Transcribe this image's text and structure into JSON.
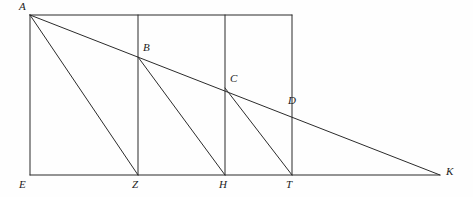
{
  "figure": {
    "width": 473,
    "height": 197,
    "background_color": "#fefefe",
    "stroke_color": "#2b2b2b",
    "stroke_width": 1,
    "label_color": "#1b1b1b"
  },
  "points": [
    {
      "id": "A",
      "label": "A",
      "x": 30,
      "y": 15,
      "label_x": 19,
      "label_y": 1
    },
    {
      "id": "B",
      "label": "B",
      "x": 138,
      "y": 57,
      "label_x": 143,
      "label_y": 42
    },
    {
      "id": "C",
      "label": "C",
      "x": 225,
      "y": 88,
      "label_x": 230,
      "label_y": 73
    },
    {
      "id": "D",
      "label": "D",
      "x": 292,
      "y": 108,
      "label_x": 288,
      "label_y": 95
    },
    {
      "id": "E",
      "label": "E",
      "x": 30,
      "y": 175,
      "label_x": 19,
      "label_y": 179
    },
    {
      "id": "Z",
      "label": "Z",
      "x": 138,
      "y": 175,
      "label_x": 132,
      "label_y": 179
    },
    {
      "id": "H",
      "label": "H",
      "x": 225,
      "y": 175,
      "label_x": 219,
      "label_y": 179
    },
    {
      "id": "T",
      "label": "T",
      "x": 292,
      "y": 175,
      "label_x": 286,
      "label_y": 179
    },
    {
      "id": "K",
      "label": "K",
      "x": 440,
      "y": 175,
      "label_x": 446,
      "label_y": 166
    }
  ],
  "segments": [
    {
      "id": "baseline-E-K",
      "name": "baseline-segment-EK",
      "from": "E",
      "to": "K"
    },
    {
      "id": "top-A-T",
      "name": "top-edge-segment-AD",
      "from": "A",
      "to": "D"
    },
    {
      "id": "vertical-A-E",
      "name": "vertical-segment-AE",
      "from": "A",
      "to": "E"
    },
    {
      "id": "vertical-B-Z",
      "name": "vertical-segment-BZ",
      "from": "B",
      "to": "Z"
    },
    {
      "id": "vertical-C-H",
      "name": "vertical-segment-CH",
      "from": "C",
      "to": "H"
    },
    {
      "id": "vertical-D-T",
      "name": "vertical-segment-DT",
      "from": "D",
      "to": "T"
    },
    {
      "id": "diagonal-A-K",
      "name": "diagonal-segment-AK",
      "from": "A",
      "to": "K"
    },
    {
      "id": "diagonal-A-Z",
      "name": "diagonal-segment-AZ",
      "from": "A",
      "to": "Z"
    },
    {
      "id": "diagonal-B-H",
      "name": "diagonal-segment-BH",
      "from": "B",
      "to": "H"
    },
    {
      "id": "diagonal-C-T",
      "name": "diagonal-segment-CT",
      "from": "C",
      "to": "T"
    }
  ],
  "vertical_extents": {
    "top_y": 15,
    "baseline_y": 175,
    "z_top_y": 15,
    "h_top_y": 15,
    "t_top_y": 15
  }
}
